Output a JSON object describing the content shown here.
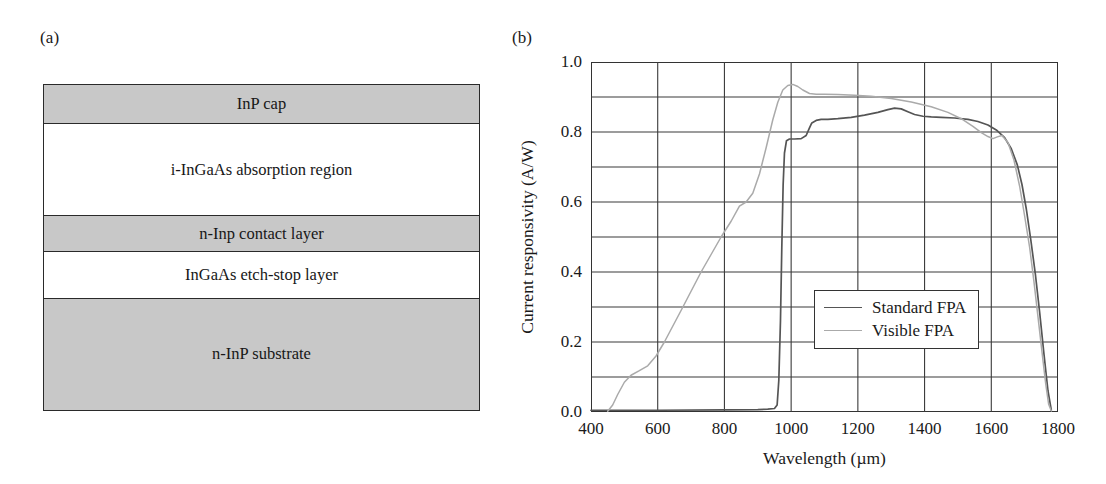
{
  "figure": {
    "panel_a": {
      "label": "(a)",
      "layers": [
        {
          "name": "InP cap",
          "shaded": true
        },
        {
          "name": "i-InGaAs absorption region",
          "shaded": false
        },
        {
          "name": "n-Inp contact layer",
          "shaded": true
        },
        {
          "name": "InGaAs etch-stop layer",
          "shaded": false
        },
        {
          "name": "n-InP substrate",
          "shaded": true
        }
      ],
      "shade_color": "#c8c8c8",
      "outline_color": "#2a2a2a"
    },
    "panel_b": {
      "label": "(b)"
    }
  },
  "chart_data": {
    "type": "line",
    "title": "",
    "xlabel": "Wavelength (µm)",
    "ylabel": "Current responsivity (A/W)",
    "xlim": [
      400,
      1800
    ],
    "ylim": [
      0.0,
      1.0
    ],
    "xticks": [
      400,
      600,
      800,
      1000,
      1200,
      1400,
      1600,
      1800
    ],
    "xtick_labels": [
      "400",
      "600",
      "800",
      "1000",
      "1200",
      "1400",
      "1600",
      "1800"
    ],
    "yticks": [
      0.0,
      0.2,
      0.4,
      0.6,
      0.8,
      1.0
    ],
    "ytick_labels": [
      "0.0",
      "0.2",
      "0.4",
      "0.6",
      "0.8",
      "1.0"
    ],
    "y_minor_step": 0.1,
    "grid": true,
    "grid_x_step": 200,
    "legend_position": "center-right-lower",
    "series": [
      {
        "name": "Standard FPA",
        "color": "#555555",
        "x": [
          400,
          600,
          800,
          900,
          930,
          950,
          958,
          963,
          968,
          972,
          976,
          980,
          986,
          995,
          1010,
          1030,
          1045,
          1055,
          1062,
          1075,
          1090,
          1110,
          1140,
          1180,
          1220,
          1260,
          1290,
          1310,
          1330,
          1350,
          1370,
          1395,
          1420,
          1450,
          1490,
          1530,
          1560,
          1590,
          1615,
          1640,
          1660,
          1678,
          1692,
          1705,
          1718,
          1732,
          1745,
          1758,
          1770,
          1780
        ],
        "y": [
          0.005,
          0.005,
          0.006,
          0.007,
          0.008,
          0.01,
          0.02,
          0.09,
          0.26,
          0.47,
          0.65,
          0.74,
          0.775,
          0.78,
          0.78,
          0.781,
          0.79,
          0.812,
          0.826,
          0.833,
          0.836,
          0.836,
          0.838,
          0.842,
          0.848,
          0.856,
          0.864,
          0.868,
          0.866,
          0.858,
          0.85,
          0.845,
          0.843,
          0.842,
          0.84,
          0.836,
          0.83,
          0.82,
          0.806,
          0.784,
          0.752,
          0.706,
          0.65,
          0.58,
          0.495,
          0.395,
          0.285,
          0.165,
          0.06,
          0.005
        ]
      },
      {
        "name": "Visible FPA",
        "color": "#aaaaaa",
        "x": [
          450,
          465,
          480,
          500,
          520,
          545,
          570,
          595,
          620,
          645,
          670,
          700,
          730,
          760,
          790,
          820,
          845,
          865,
          885,
          905,
          925,
          945,
          960,
          975,
          990,
          1005,
          1020,
          1035,
          1055,
          1075,
          1100,
          1140,
          1190,
          1240,
          1300,
          1360,
          1420,
          1470,
          1510,
          1545,
          1570,
          1590,
          1605,
          1618,
          1632,
          1650,
          1668,
          1685,
          1700,
          1715,
          1728,
          1740,
          1752,
          1763,
          1772,
          1780
        ],
        "y": [
          0.002,
          0.02,
          0.05,
          0.085,
          0.105,
          0.118,
          0.132,
          0.16,
          0.2,
          0.245,
          0.29,
          0.345,
          0.4,
          0.45,
          0.5,
          0.545,
          0.588,
          0.6,
          0.625,
          0.68,
          0.755,
          0.835,
          0.885,
          0.92,
          0.933,
          0.936,
          0.93,
          0.92,
          0.91,
          0.908,
          0.908,
          0.907,
          0.905,
          0.902,
          0.896,
          0.886,
          0.872,
          0.856,
          0.838,
          0.816,
          0.798,
          0.787,
          0.781,
          0.786,
          0.79,
          0.77,
          0.72,
          0.645,
          0.56,
          0.47,
          0.372,
          0.272,
          0.172,
          0.082,
          0.022,
          0.003
        ]
      }
    ]
  },
  "legend": {
    "entries": [
      {
        "label": "Standard FPA",
        "color": "#555555"
      },
      {
        "label": "Visible FPA",
        "color": "#aaaaaa"
      }
    ]
  }
}
